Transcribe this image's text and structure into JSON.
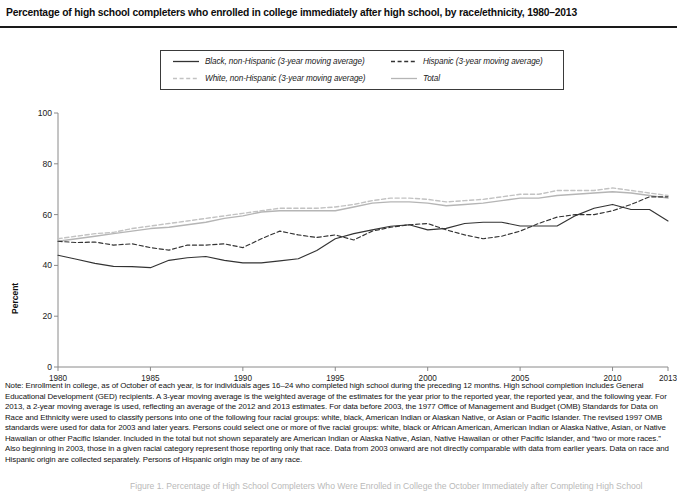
{
  "title": "Percentage of high school completers who enrolled in college immediately after high school, by race/ethnicity, 1980–2013",
  "legend": {
    "items": [
      {
        "label": "Black, non-Hispanic (3-year moving average)",
        "style": "solid",
        "color": "#333333",
        "width": 1.3
      },
      {
        "label": "Hispanic (3-year moving average)",
        "style": "dashed",
        "color": "#333333",
        "width": 1.3
      },
      {
        "label": "White, non-Hispanic (3-year moving average)",
        "style": "dashed",
        "color": "#c2c2c2",
        "width": 1.3
      },
      {
        "label": "Total",
        "style": "solid",
        "color": "#b5b5b5",
        "width": 1.3
      }
    ]
  },
  "axes": {
    "ylabel": "Percent",
    "yticks": [
      0,
      20,
      40,
      60,
      80,
      100
    ],
    "ylim": [
      0,
      100
    ],
    "xticks": [
      1980,
      1985,
      1990,
      1995,
      2000,
      2005,
      2010,
      2013
    ],
    "xlim": [
      1980,
      2013
    ]
  },
  "note": "Note: Enrollment in college, as of October of each year, is for individuals ages 16–24 who completed high school during the preceding 12 months. High school completion includes General Educational Development (GED) recipients. A 3-year moving average is the weighted average of the estimates for the year prior to the reported year, the reported year, and the following year. For 2013, a 2-year moving average is used, reflecting an average of the 2012 and 2013 estimates. For data before 2003, the 1977 Office of Management and Budget (OMB) Standards for Data on Race and Ethnicity were used to classify persons into one of the following four racial groups: white, black, American Indian or Alaskan Native, or Asian or Pacific Islander. The revised 1997 OMB standards were used for data for 2003 and later years. Persons could select one or more of five racial groups: white, black or African American, American Indian or Alaska Native, Asian, or Native Hawaiian or other Pacific Islander. Included in the total but not shown separately are American Indian or Alaska Native, Asian, Native Hawaiian or other Pacific Islander, and “two or more races.” Also beginning in 2003, those in a given racial category represent those reporting only that race. Data from 2003 onward are not directly comparable with data from earlier years. Data on race and Hispanic origin are collected separately. Persons of Hispanic origin may be of any race.",
  "source_cut": "Figure 1. Percentage of High School Completers Who Were Enrolled in College the October Immediately after Completing High School",
  "chart_data": {
    "type": "line",
    "title": "Percentage of high school completers who enrolled in college immediately after high school, by race/ethnicity, 1980–2013",
    "xlabel": "",
    "ylabel": "Percent",
    "xlim": [
      1980,
      2013
    ],
    "ylim": [
      0,
      100
    ],
    "grid": false,
    "legend_position": "top-center",
    "x": [
      1980,
      1981,
      1982,
      1983,
      1984,
      1985,
      1986,
      1987,
      1988,
      1989,
      1990,
      1991,
      1992,
      1993,
      1994,
      1995,
      1996,
      1997,
      1998,
      1999,
      2000,
      2001,
      2002,
      2003,
      2004,
      2005,
      2006,
      2007,
      2008,
      2009,
      2010,
      2011,
      2012,
      2013
    ],
    "series": [
      {
        "name": "Black, non-Hispanic (3-year moving average)",
        "style": "solid",
        "color": "#333333",
        "values": [
          44.0,
          42.4,
          40.8,
          39.6,
          39.5,
          39.1,
          42.0,
          43.0,
          43.5,
          42.0,
          41.0,
          41.0,
          41.8,
          42.6,
          45.9,
          50.5,
          52.5,
          54.0,
          55.4,
          56.0,
          54.0,
          54.6,
          56.5,
          57.0,
          57.0,
          55.5,
          55.5,
          55.5,
          59.6,
          62.5,
          64.0,
          62.0,
          62.0,
          57.5
        ]
      },
      {
        "name": "Hispanic (3-year moving average)",
        "style": "dashed",
        "color": "#333333",
        "values": [
          49.5,
          49.0,
          49.2,
          48.0,
          48.5,
          47.0,
          46.0,
          48.0,
          48.0,
          48.5,
          47.0,
          50.5,
          53.5,
          52.0,
          51.0,
          52.0,
          50.0,
          53.5,
          55.0,
          56.0,
          56.5,
          54.0,
          52.0,
          50.5,
          51.5,
          53.5,
          56.5,
          59.0,
          60.0,
          60.0,
          61.5,
          64.0,
          67.0,
          67.0
        ]
      },
      {
        "name": "White, non-Hispanic (3-year moving average)",
        "style": "dashed",
        "color": "#c2c2c2",
        "values": [
          50.5,
          51.5,
          52.5,
          53.0,
          54.5,
          55.5,
          56.5,
          57.5,
          58.5,
          59.5,
          60.5,
          61.5,
          62.5,
          62.5,
          62.5,
          63.0,
          64.0,
          65.5,
          66.5,
          66.5,
          66.0,
          65.0,
          65.5,
          66.0,
          67.0,
          68.0,
          68.0,
          69.5,
          69.5,
          69.5,
          70.5,
          69.5,
          68.5,
          67.5
        ]
      },
      {
        "name": "Total",
        "style": "solid",
        "color": "#b5b5b5",
        "values": [
          49.5,
          50.5,
          51.5,
          52.5,
          53.5,
          54.5,
          55.0,
          56.0,
          57.0,
          58.5,
          59.5,
          61.0,
          61.5,
          61.5,
          61.5,
          61.5,
          63.0,
          64.5,
          65.0,
          65.0,
          64.5,
          63.5,
          64.0,
          64.5,
          65.5,
          66.5,
          66.5,
          67.5,
          68.0,
          68.5,
          69.0,
          68.5,
          67.5,
          66.5
        ]
      }
    ]
  }
}
